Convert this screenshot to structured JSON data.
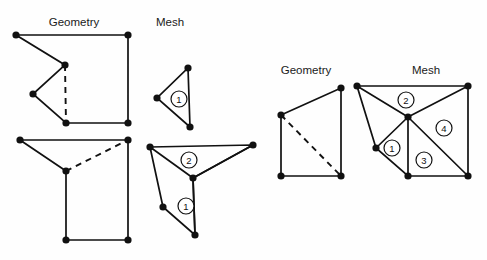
{
  "figure": {
    "background_color": "#fefefe",
    "stroke_color": "#111111",
    "node_color": "#111111",
    "label_fill": "#ffffff"
  },
  "captions": [
    {
      "id": "caption-geometry-left",
      "text": "Geometry",
      "x": 74,
      "y": 26
    },
    {
      "id": "caption-mesh-left",
      "text": "Mesh",
      "x": 170,
      "y": 26
    },
    {
      "id": "caption-geometry-right",
      "text": "Geometry",
      "x": 306,
      "y": 74
    },
    {
      "id": "caption-mesh-right",
      "text": "Mesh",
      "x": 426,
      "y": 74
    }
  ],
  "panels": [
    {
      "id": "panel-geometry-top-left",
      "kind": "geometry",
      "outline": [
        [
          16,
          35
        ],
        [
          128,
          35
        ],
        [
          128,
          123
        ],
        [
          66,
          123
        ],
        [
          33,
          94
        ],
        [
          65,
          65
        ]
      ],
      "dashed_edges": [
        [
          [
            65,
            65
          ],
          [
            66,
            123
          ]
        ]
      ],
      "nodes": [
        [
          16,
          35
        ],
        [
          128,
          35
        ],
        [
          128,
          123
        ],
        [
          66,
          123
        ],
        [
          33,
          94
        ],
        [
          65,
          65
        ]
      ],
      "region_labels": []
    },
    {
      "id": "panel-mesh-top-left",
      "kind": "mesh",
      "outline": [
        [
          188,
          68
        ],
        [
          190,
          127
        ],
        [
          157,
          98
        ]
      ],
      "dashed_edges": [],
      "nodes": [
        [
          188,
          68
        ],
        [
          190,
          127
        ],
        [
          157,
          98
        ]
      ],
      "region_labels": [
        {
          "text": "1",
          "x": 179,
          "y": 99,
          "r": 8
        }
      ]
    },
    {
      "id": "panel-geometry-bottom-left",
      "kind": "geometry",
      "outline": [
        [
          20,
          140
        ],
        [
          128,
          140
        ],
        [
          128,
          240
        ],
        [
          66,
          240
        ],
        [
          66,
          171
        ]
      ],
      "dashed_edges": [
        [
          [
            66,
            171
          ],
          [
            128,
            140
          ]
        ]
      ],
      "nodes": [
        [
          20,
          140
        ],
        [
          128,
          140
        ],
        [
          128,
          240
        ],
        [
          66,
          240
        ],
        [
          66,
          171
        ]
      ],
      "region_labels": []
    },
    {
      "id": "panel-mesh-bottom-left",
      "kind": "mesh",
      "outline": [
        [
          150,
          147
        ],
        [
          253,
          145
        ],
        [
          193,
          178
        ],
        [
          195,
          235
        ],
        [
          163,
          207
        ]
      ],
      "extra_edges": [
        [
          [
            150,
            147
          ],
          [
            193,
            178
          ]
        ],
        [
          [
            253,
            145
          ],
          [
            193,
            178
          ]
        ],
        [
          [
            193,
            178
          ],
          [
            195,
            235
          ]
        ]
      ],
      "dashed_edges": [],
      "nodes": [
        [
          150,
          147
        ],
        [
          253,
          145
        ],
        [
          193,
          178
        ],
        [
          195,
          235
        ],
        [
          163,
          207
        ]
      ],
      "region_labels": [
        {
          "text": "2",
          "x": 189,
          "y": 160,
          "r": 8
        },
        {
          "text": "1",
          "x": 186,
          "y": 206,
          "r": 8
        }
      ]
    },
    {
      "id": "panel-geometry-right",
      "kind": "geometry",
      "outline": [
        [
          281,
          115
        ],
        [
          341,
          88
        ],
        [
          341,
          176
        ],
        [
          281,
          176
        ]
      ],
      "dashed_edges": [
        [
          [
            281,
            115
          ],
          [
            341,
            176
          ]
        ]
      ],
      "nodes": [
        [
          281,
          115
        ],
        [
          341,
          88
        ],
        [
          341,
          176
        ],
        [
          281,
          176
        ]
      ],
      "region_labels": []
    },
    {
      "id": "panel-mesh-right",
      "kind": "mesh",
      "outline": [
        [
          357,
          86
        ],
        [
          468,
          86
        ],
        [
          468,
          176
        ],
        [
          408,
          176
        ],
        [
          376,
          148
        ]
      ],
      "extra_edges": [
        [
          [
            357,
            86
          ],
          [
            408,
            117
          ]
        ],
        [
          [
            468,
            86
          ],
          [
            408,
            117
          ]
        ],
        [
          [
            376,
            148
          ],
          [
            408,
            117
          ]
        ],
        [
          [
            408,
            117
          ],
          [
            408,
            176
          ]
        ],
        [
          [
            408,
            117
          ],
          [
            468,
            176
          ]
        ]
      ],
      "dashed_edges": [],
      "nodes": [
        [
          357,
          86
        ],
        [
          468,
          86
        ],
        [
          468,
          176
        ],
        [
          408,
          176
        ],
        [
          376,
          148
        ],
        [
          408,
          117
        ]
      ],
      "region_labels": [
        {
          "text": "2",
          "x": 406,
          "y": 100,
          "r": 8
        },
        {
          "text": "4",
          "x": 444,
          "y": 128,
          "r": 8
        },
        {
          "text": "1",
          "x": 392,
          "y": 148,
          "r": 8
        },
        {
          "text": "3",
          "x": 424,
          "y": 160,
          "r": 8
        }
      ]
    }
  ]
}
